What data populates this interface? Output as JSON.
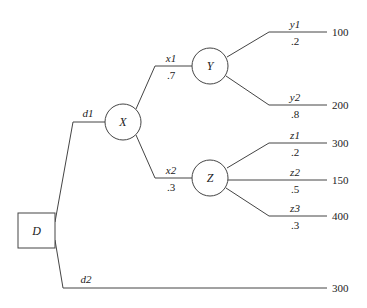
{
  "diagram": {
    "type": "decision-tree",
    "nodes": {
      "decision": {
        "label": "D",
        "shape": "square"
      },
      "chanceX": {
        "label": "X",
        "shape": "circle"
      },
      "chanceY": {
        "label": "Y",
        "shape": "circle"
      },
      "chanceZ": {
        "label": "Z",
        "shape": "circle"
      }
    },
    "branches": {
      "d1": {
        "label": "d1"
      },
      "d2": {
        "label": "d2",
        "payoff": "300"
      },
      "x1": {
        "label": "x1",
        "prob": ".7"
      },
      "x2": {
        "label": "x2",
        "prob": ".3"
      },
      "y1": {
        "label": "y1",
        "prob": ".2",
        "payoff": "100"
      },
      "y2": {
        "label": "y2",
        "prob": ".8",
        "payoff": "200"
      },
      "z1": {
        "label": "z1",
        "prob": ".2",
        "payoff": "300"
      },
      "z2": {
        "label": "z2",
        "prob": ".5",
        "payoff": "150"
      },
      "z3": {
        "label": "z3",
        "prob": ".3",
        "payoff": "400"
      }
    }
  }
}
